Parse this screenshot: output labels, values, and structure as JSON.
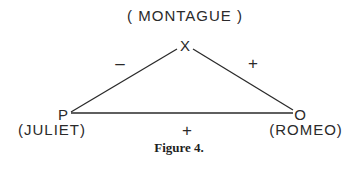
{
  "diagram": {
    "type": "balance-triangle",
    "nodes": {
      "x": {
        "letter": "X",
        "name": "( MONTAGUE )"
      },
      "p": {
        "letter": "P",
        "name": "(JULIET)"
      },
      "o": {
        "letter": "O",
        "name": "(ROMEO)"
      }
    },
    "edges": {
      "p_x": {
        "sign": "–"
      },
      "x_o": {
        "sign": "+"
      },
      "p_o": {
        "sign": "+"
      }
    },
    "line_color": "#2a2a2a",
    "caption": "Figure 4."
  }
}
